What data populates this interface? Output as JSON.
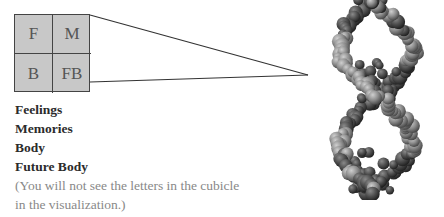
{
  "cubicle": {
    "cells": [
      {
        "letter": "F"
      },
      {
        "letter": "M"
      },
      {
        "letter": "B"
      },
      {
        "letter": "FB"
      }
    ],
    "fill_color": "#c8c8c8",
    "border_color": "#444444"
  },
  "legend": {
    "items": [
      {
        "label": "Feelings"
      },
      {
        "label": "Memories"
      },
      {
        "label": "Body"
      },
      {
        "label": "Future Body"
      }
    ]
  },
  "note": {
    "line1": "(You will not see the letters in the cubicle",
    "line2": "in the visualization.)"
  },
  "visualization": {
    "subject": "dna-double-helix-space-filling-model",
    "sphere_color": "#8a8a8a"
  }
}
